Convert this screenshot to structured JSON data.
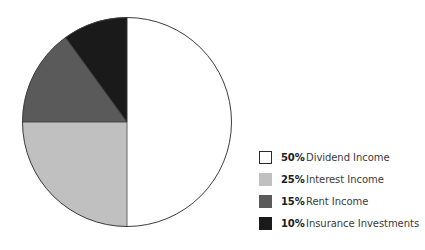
{
  "chart_data": {
    "type": "pie",
    "title": "",
    "categories": [
      "Dividend Income",
      "Interest Income",
      "Rent Income",
      "Insurance Investments"
    ],
    "values": [
      50,
      25,
      15,
      10
    ],
    "value_labels": [
      "50%",
      "25%",
      "15%",
      "10%"
    ],
    "colors": [
      "#ffffff",
      "#c0c0c0",
      "#5a5a5a",
      "#1a1a1a"
    ],
    "start_angle_clock": "12 o'clock",
    "direction": "clockwise",
    "outline_color": "#3c3c3c",
    "legend_position": "right",
    "grid": false
  },
  "legend": {
    "items": [
      {
        "pct": "50%",
        "label": "Dividend Income",
        "color": "#ffffff",
        "outlined": true
      },
      {
        "pct": "25%",
        "label": "Interest Income",
        "color": "#c0c0c0",
        "outlined": false
      },
      {
        "pct": "15%",
        "label": "Rent Income",
        "color": "#5a5a5a",
        "outlined": false
      },
      {
        "pct": "10%",
        "label": "Insurance Investments",
        "color": "#1a1a1a",
        "outlined": false
      }
    ]
  }
}
